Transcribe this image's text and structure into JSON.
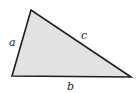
{
  "diagram": {
    "type": "triangle",
    "fill_color": "#e2e2e2",
    "stroke_color": "#1e1e1e",
    "vertices": {
      "top": [
        31,
        10
      ],
      "bottom_left": [
        12,
        76
      ],
      "bottom_right": [
        131,
        77
      ]
    },
    "side_labels": {
      "a": "a",
      "b": "b",
      "c": "c"
    }
  }
}
